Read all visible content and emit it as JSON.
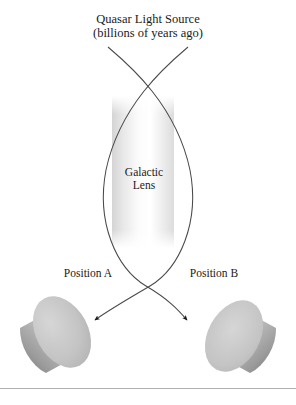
{
  "figure": {
    "type": "gravitational-lensing-diagram",
    "background_color": "#ffffff"
  },
  "source": {
    "title": "Quasar Light Source",
    "subtitle": "(billions of years ago)"
  },
  "lens": {
    "label_line1": "Galactic",
    "label_line2": "Lens",
    "band_color_light": "#ffffff",
    "band_color_shade": "#d8d8d8",
    "outline_color": "#6b6b6b"
  },
  "observers": [
    {
      "label": "Position A",
      "orientation": "face-upper-right",
      "body_color": "#b8b8b8",
      "face_color": "#c9c9c9",
      "shadow_color": "#6e6e6e"
    },
    {
      "label": "Position B",
      "orientation": "face-lower-left",
      "body_color": "#b8b8b8",
      "face_color": "#c9c9c9",
      "shadow_color": "#6e6e6e"
    }
  ],
  "rays": {
    "stroke_color": "#4a4a4a",
    "arrowhead_color": "#1a1a1a",
    "description": "two light paths from quasar bending around the galactic lens to two observer positions"
  },
  "footer_rule": {
    "color": "#b0b0b0"
  },
  "colors": {
    "text": "#1a1a1a",
    "line": "#4a4a4a"
  }
}
